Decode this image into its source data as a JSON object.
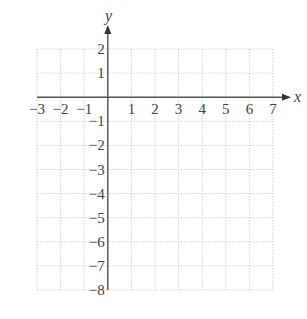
{
  "chart_data": {
    "type": "scatter",
    "title": "",
    "xlabel": "x",
    "ylabel": "y",
    "xlim": [
      -3,
      7
    ],
    "ylim": [
      -8,
      2
    ],
    "grid": true,
    "x_ticks": [
      "−3",
      "−2",
      "−1",
      "1",
      "2",
      "3",
      "4",
      "5",
      "6",
      "7"
    ],
    "y_ticks": [
      "2",
      "1",
      "−1",
      "−2",
      "−3",
      "−4",
      "−5",
      "−6",
      "−7",
      "−8"
    ],
    "series": []
  },
  "colors": {
    "axis": "#555555",
    "grid": "#cfcfcf",
    "text": "#444444"
  }
}
